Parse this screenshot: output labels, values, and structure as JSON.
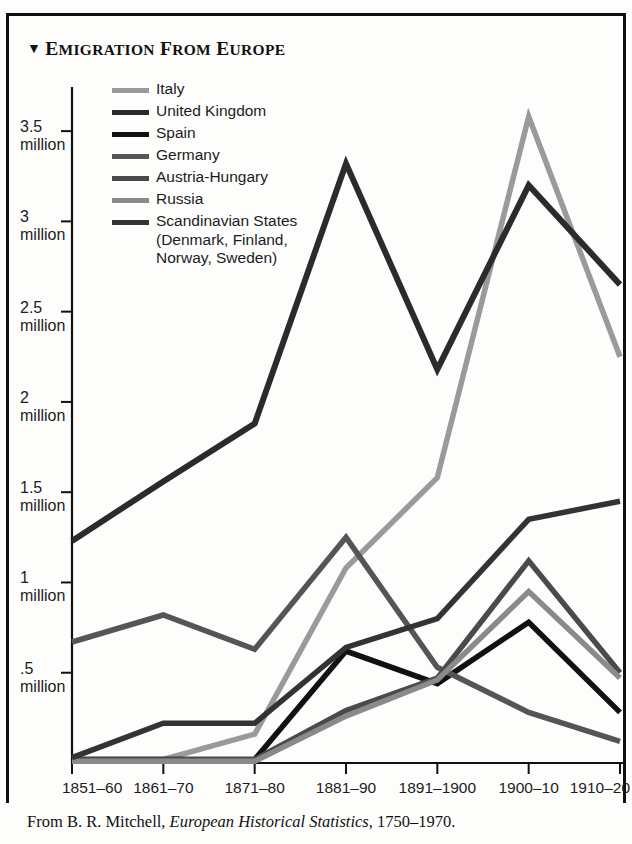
{
  "title": {
    "marker": "▼",
    "text": "Emigration from Europe"
  },
  "source_note": {
    "prefix": "From B. R. Mitchell, ",
    "work": "European Historical Statistics",
    "suffix": ", 1750–1970."
  },
  "legend": {
    "position": "inside-top-left",
    "items": [
      {
        "label": "Italy",
        "color": "#9a9a9a"
      },
      {
        "label": "United Kingdom",
        "color": "#2b2b2b"
      },
      {
        "label": "Spain",
        "color": "#111111"
      },
      {
        "label": "Germany",
        "color": "#555555"
      },
      {
        "label": "Austria-Hungary",
        "color": "#4a4a4a"
      },
      {
        "label": "Russia",
        "color": "#8a8a8a"
      },
      {
        "label": "Scandinavian States\n(Denmark, Finland,\nNorway, Sweden)",
        "color": "#333333"
      }
    ]
  },
  "axes": {
    "y_ticks": [
      {
        "value": 3.5,
        "label": "3.5\nmillion"
      },
      {
        "value": 3.0,
        "label": "3\nmillion"
      },
      {
        "value": 2.5,
        "label": "2.5\nmillion"
      },
      {
        "value": 2.0,
        "label": "2\nmillion"
      },
      {
        "value": 1.5,
        "label": "1.5\nmillion"
      },
      {
        "value": 1.0,
        "label": "1\nmillion"
      },
      {
        "value": 0.5,
        "label": ".5\nmillion"
      }
    ],
    "x_ticks": [
      "1851–60",
      "1861–70",
      "1871–80",
      "1881–90",
      "1891–1900",
      "1900–10",
      "1910–20"
    ]
  },
  "chart_data": {
    "type": "line",
    "title": "Emigration from Europe",
    "xlabel": "",
    "ylabel": "millions of emigrants",
    "ylim": [
      0,
      3.7
    ],
    "grid": false,
    "legend_position": "inside-top-left",
    "units": "millions",
    "categories": [
      "1851–60",
      "1861–70",
      "1871–80",
      "1881–90",
      "1891–1900",
      "1900–10",
      "1910–20"
    ],
    "series": [
      {
        "name": "Italy",
        "color": "#9a9a9a",
        "width": 5.5,
        "values": [
          0.02,
          0.02,
          0.16,
          1.08,
          1.58,
          3.58,
          2.25
        ]
      },
      {
        "name": "United Kingdom",
        "color": "#2b2b2b",
        "width": 6.0,
        "values": [
          1.23,
          1.56,
          1.88,
          3.32,
          2.18,
          3.2,
          2.65
        ]
      },
      {
        "name": "Spain",
        "color": "#111111",
        "width": 5.5,
        "values": [
          0.02,
          0.02,
          0.02,
          0.62,
          0.44,
          0.78,
          0.28
        ]
      },
      {
        "name": "Germany",
        "color": "#555555",
        "width": 5.5,
        "values": [
          0.67,
          0.82,
          0.63,
          1.25,
          0.53,
          0.28,
          0.12
        ]
      },
      {
        "name": "Austria-Hungary",
        "color": "#4a4a4a",
        "width": 5.5,
        "values": [
          0.02,
          0.02,
          0.02,
          0.29,
          0.47,
          1.12,
          0.5
        ]
      },
      {
        "name": "Russia",
        "color": "#8a8a8a",
        "width": 5.5,
        "values": [
          0.01,
          0.01,
          0.01,
          0.26,
          0.46,
          0.95,
          0.47
        ]
      },
      {
        "name": "Scandinavian States",
        "color": "#333333",
        "width": 5.5,
        "values": [
          0.03,
          0.22,
          0.22,
          0.64,
          0.8,
          1.35,
          1.45
        ]
      }
    ]
  }
}
